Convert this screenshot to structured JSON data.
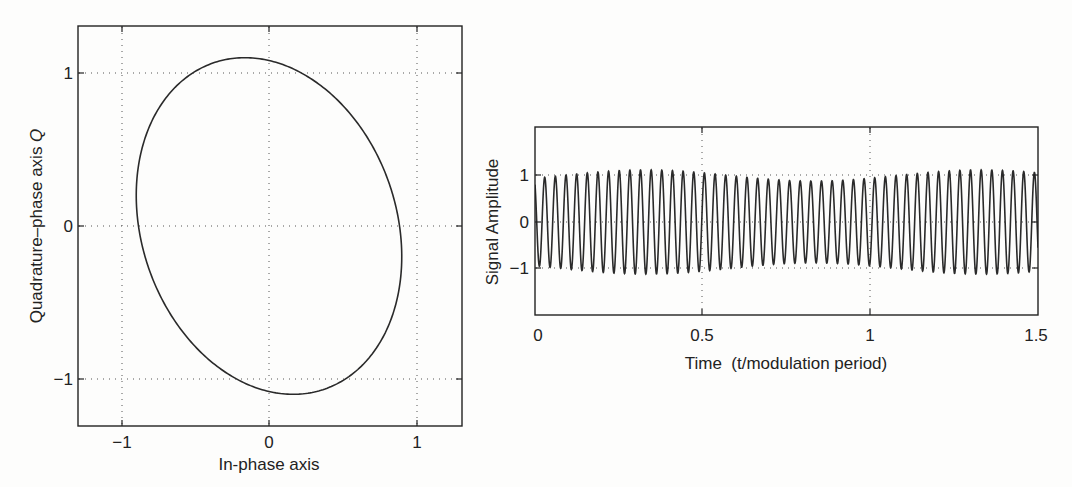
{
  "chart_data": [
    {
      "type": "line",
      "subtype": "parametric (IQ / phasor trajectory)",
      "title": "",
      "xlabel": "In-phase axis",
      "ylabel": "Quadrature-phase axis Q",
      "xlim": [
        -1.3,
        1.3
      ],
      "ylim": [
        -1.3,
        1.3
      ],
      "xticks": [
        -1,
        0,
        1
      ],
      "xtick_labels": [
        "−1",
        "0",
        "1"
      ],
      "yticks": [
        -1,
        0,
        1
      ],
      "ytick_labels": [
        "−1",
        "0",
        "1"
      ],
      "grid": true,
      "grid_style": "dotted",
      "legend": null,
      "series": [
        {
          "name": "IQ trajectory",
          "description": "Tilted closed ellipse: I = 0.9·cosθ, Q = 1.1·sin(θ − 0.183)",
          "I_amplitude": 0.9,
          "Q_amplitude": 1.1,
          "phase_offset_rad": 0.183,
          "key_points": [
            {
              "label": "top",
              "x": -0.16,
              "y": 1.1
            },
            {
              "label": "right",
              "x": 0.9,
              "y": -0.2
            },
            {
              "label": "bottom",
              "x": 0.16,
              "y": -1.1
            },
            {
              "label": "left",
              "x": -0.9,
              "y": 0.2
            }
          ]
        }
      ]
    },
    {
      "type": "line",
      "title": "",
      "xlabel": "Time  (t/modulation period)",
      "ylabel": "Signal Amplitude",
      "xlim": [
        0,
        1.5
      ],
      "ylim": [
        -2,
        2
      ],
      "xticks": [
        0,
        0.5,
        1,
        1.5
      ],
      "xtick_labels": [
        "0",
        "0.5",
        "1",
        "1.5"
      ],
      "yticks": [
        -1,
        0,
        1
      ],
      "ytick_labels": [
        "−1",
        "0",
        "1"
      ],
      "grid": true,
      "grid_style": "dotted",
      "legend": null,
      "series": [
        {
          "name": "Modulated carrier",
          "description": "Carrier oscillation with slowly varying envelope between ~0.88 and ~1.12",
          "carrier_cycles_per_modulation_period": 31.5,
          "envelope_min": 0.88,
          "envelope_max": 1.12,
          "envelope_peaks_at": [
            0.33,
            0.83,
            1.33
          ],
          "envelope_troughs_at": [
            0.08,
            0.58,
            1.08
          ]
        }
      ]
    }
  ],
  "left_plot": {
    "xlabel": "In-phase axis",
    "ylabel_prefix": "Quadrature–phase axis ",
    "ylabel_symbol": "Q",
    "xticks": [
      "−1",
      "0",
      "1"
    ],
    "yticks": [
      "1",
      "0",
      "−1"
    ]
  },
  "right_plot": {
    "xlabel": "Time  (t/modulation period)",
    "ylabel": "Signal Amplitude",
    "xticks": [
      "0",
      "0.5",
      "1",
      "1.5"
    ],
    "yticks": [
      "1",
      "0",
      "−1"
    ]
  }
}
